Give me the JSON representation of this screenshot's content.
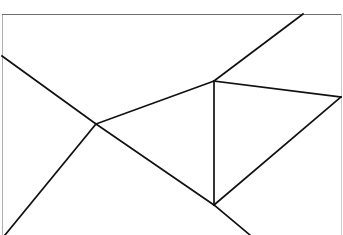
{
  "figure": {
    "canvas": {
      "width": 343,
      "height": 235,
      "background_color": "#ffffff"
    },
    "style": {
      "line_color": "#111111",
      "line_width": 1.7,
      "frame_color": "#6e6e6e",
      "frame_width": 1
    },
    "frame": {
      "name": "rectangular-border",
      "top_y": 14,
      "left_x": 2,
      "right_x": 341,
      "bottom_y": 235,
      "bottom_visible": false
    },
    "vertices": [
      {
        "id": "V1",
        "name": "center-junction",
        "x": 96,
        "y": 124
      },
      {
        "id": "V2",
        "name": "upper-right-junction",
        "x": 214,
        "y": 81
      },
      {
        "id": "V3",
        "name": "lower-right-junction",
        "x": 214,
        "y": 205
      },
      {
        "id": "V4",
        "name": "right-edge-vertex",
        "x": 341,
        "y": 97
      },
      {
        "id": "E1",
        "name": "left-edge-endpoint",
        "x": 2,
        "y": 56
      },
      {
        "id": "E2",
        "name": "bottom-left-endpoint",
        "x": 5,
        "y": 235
      },
      {
        "id": "E3",
        "name": "top-edge-endpoint",
        "x": 303,
        "y": 14
      },
      {
        "id": "E4",
        "name": "bottom-right-endpoint",
        "x": 250,
        "y": 235
      }
    ],
    "segments": [
      {
        "id": "S1",
        "name": "segment-left-edge-to-center",
        "from": "E1",
        "to": "V1",
        "x1": 2,
        "y1": 56,
        "x2": 96,
        "y2": 124
      },
      {
        "id": "S2",
        "name": "segment-center-to-bottom-left",
        "from": "V1",
        "to": "E2",
        "x1": 96,
        "y1": 124,
        "x2": 5,
        "y2": 235
      },
      {
        "id": "S3",
        "name": "segment-center-to-upper-junction",
        "from": "V1",
        "to": "V2",
        "x1": 96,
        "y1": 124,
        "x2": 214,
        "y2": 81
      },
      {
        "id": "S4",
        "name": "segment-center-to-lower-junction",
        "from": "V1",
        "to": "V3",
        "x1": 96,
        "y1": 124,
        "x2": 214,
        "y2": 205
      },
      {
        "id": "S5",
        "name": "segment-upper-junction-to-top-edge",
        "from": "V2",
        "to": "E3",
        "x1": 214,
        "y1": 81,
        "x2": 303,
        "y2": 14
      },
      {
        "id": "S6",
        "name": "segment-upper-junction-to-right-vertex",
        "from": "V2",
        "to": "V4",
        "x1": 214,
        "y1": 81,
        "x2": 341,
        "y2": 97
      },
      {
        "id": "S7",
        "name": "segment-vertical-connector",
        "from": "V2",
        "to": "V3",
        "x1": 214,
        "y1": 81,
        "x2": 214,
        "y2": 205
      },
      {
        "id": "S8",
        "name": "segment-lower-junction-to-right-vertex",
        "from": "V3",
        "to": "V4",
        "x1": 214,
        "y1": 205,
        "x2": 341,
        "y2": 97
      },
      {
        "id": "S9",
        "name": "segment-lower-junction-to-bottom-right",
        "from": "V3",
        "to": "E4",
        "x1": 214,
        "y1": 205,
        "x2": 250,
        "y2": 235
      }
    ],
    "frame_segments": [
      {
        "id": "F1",
        "name": "frame-top-border",
        "x1": 2,
        "y1": 14,
        "x2": 341,
        "y2": 14
      },
      {
        "id": "F2",
        "name": "frame-left-border",
        "x1": 2,
        "y1": 14,
        "x2": 2,
        "y2": 235
      },
      {
        "id": "F3",
        "name": "frame-right-border",
        "x1": 341,
        "y1": 14,
        "x2": 341,
        "y2": 235
      }
    ]
  }
}
